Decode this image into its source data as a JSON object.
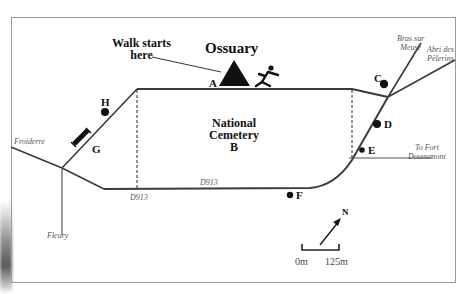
{
  "map": {
    "title": "Ossuary",
    "walk_start": [
      "Walk starts",
      "here"
    ],
    "cemetery": [
      "National",
      "Cemetery",
      "B"
    ],
    "points": {
      "A": "A",
      "C": "C",
      "D": "D",
      "E": "E",
      "F": "F",
      "G": "G",
      "H": "H"
    },
    "places": {
      "bras_sur_meuse": [
        "Bras sur",
        "Meuse"
      ],
      "abri_des_pelerins": [
        "Abri des",
        "Pèlerins"
      ],
      "to_fort_douaumont": [
        "To Fort",
        "Douaumont"
      ],
      "froiderre": "Froiderre",
      "fleury": "Fleury"
    },
    "roads": {
      "d913_top": "D913",
      "d913_bottom": "D913"
    },
    "compass": {
      "label": "N"
    },
    "scale": {
      "start": "0m",
      "end": "125m"
    },
    "colors": {
      "road": "#3a3a3a",
      "frame": "#9a9a9a",
      "text": "#111111",
      "italic_text": "#555555"
    }
  }
}
